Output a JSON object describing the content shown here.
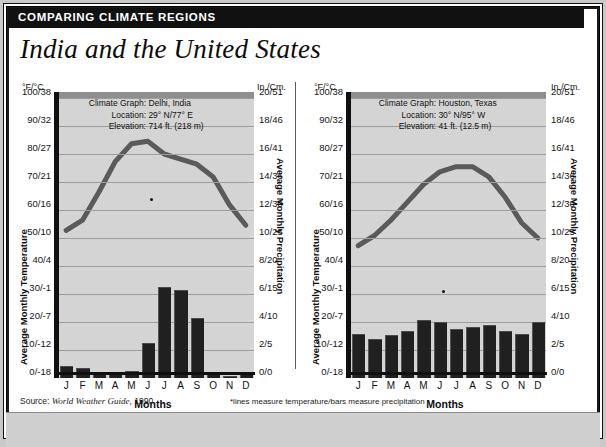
{
  "banner": {
    "title": "COMPARING CLIMATE REGIONS"
  },
  "headline": "India and the United States",
  "footer": {
    "source_prefix": "Source:",
    "source_title": "World Weather Guide",
    "source_year": ", 1990",
    "note": "*lines measure temperature/bars measure precipitation"
  },
  "axes": {
    "temp_unit": "°F/°C",
    "precip_unit": "In./Cm.",
    "temp_label": "Average Monthly Temperature",
    "precip_label": "Average Monthly Precipitation",
    "months_label": "Months",
    "temp_ticks": [
      "100/38",
      "90/32",
      "80/27",
      "70/21",
      "60/16",
      "50/10",
      "40/4",
      "30/-1",
      "20/-7",
      "10/-12",
      "0/-18"
    ],
    "precip_ticks": [
      "20/51",
      "18/46",
      "16/41",
      "14/36",
      "12/30",
      "10/25",
      "8/20",
      "6/15",
      "4/10",
      "2/5",
      "0/0"
    ],
    "months": [
      "J",
      "F",
      "M",
      "A",
      "M",
      "J",
      "J",
      "A",
      "S",
      "O",
      "N",
      "D"
    ]
  },
  "chart_data": [
    {
      "type": "bar",
      "id": "delhi",
      "title": "Climate Graph:  Delhi, India",
      "labels": {
        "graph": "Climate Graph:",
        "location": "Location:",
        "elevation": "Elevation:"
      },
      "values_text": {
        "graph": "Delhi, India",
        "location": "29° N/77° E",
        "elevation": "714 ft. (218 m)"
      },
      "categories": [
        "J",
        "F",
        "M",
        "A",
        "M",
        "J",
        "J",
        "A",
        "S",
        "O",
        "N",
        "D"
      ],
      "series": [
        {
          "name": "Average Monthly Precipitation",
          "kind": "bar",
          "unit": "in",
          "values": [
            0.9,
            0.7,
            0.4,
            0.3,
            0.5,
            2.7,
            7.1,
            6.8,
            4.6,
            0.4,
            0.1,
            0.4
          ]
        },
        {
          "name": "Average Monthly Temperature",
          "kind": "line",
          "unit": "F",
          "values": [
            58,
            62,
            73,
            85,
            92,
            93,
            88,
            86,
            84,
            79,
            68,
            60
          ]
        }
      ],
      "xlabel": "Months",
      "ylabel": "Average Monthly Temperature",
      "y2label": "Average Monthly Precipitation",
      "ylim": [
        0,
        110
      ],
      "y2lim": [
        0,
        22
      ],
      "grid": true,
      "legend": "none"
    },
    {
      "type": "bar",
      "id": "houston",
      "title": "Climate Graph:  Houston, Texas",
      "labels": {
        "graph": "Climate Graph:",
        "location": "Location:",
        "elevation": "Elevation:"
      },
      "values_text": {
        "graph": "Houston, Texas",
        "location": "30° N/95° W",
        "elevation": "41 ft. (12.5 m)"
      },
      "categories": [
        "J",
        "F",
        "M",
        "A",
        "M",
        "J",
        "J",
        "A",
        "S",
        "O",
        "N",
        "D"
      ],
      "series": [
        {
          "name": "Average Monthly Precipitation",
          "kind": "bar",
          "unit": "in",
          "values": [
            3.4,
            3.0,
            3.3,
            3.6,
            4.5,
            4.3,
            3.8,
            3.9,
            4.1,
            3.6,
            3.4,
            4.3
          ]
        },
        {
          "name": "Average Monthly Temperature",
          "kind": "line",
          "unit": "F",
          "values": [
            52,
            56,
            62,
            69,
            76,
            81,
            83,
            83,
            79,
            71,
            61,
            55
          ]
        }
      ],
      "xlabel": "Months",
      "ylabel": "Average Monthly Temperature",
      "y2label": "Average Monthly Precipitation",
      "ylim": [
        0,
        110
      ],
      "y2lim": [
        0,
        22
      ],
      "grid": true,
      "legend": "none"
    }
  ],
  "colors": {
    "banner_bg": "#111111",
    "plot_bg": "#d4d4d4",
    "bar": "#202020",
    "line": "#555555",
    "grid": "#9d9d9d"
  }
}
